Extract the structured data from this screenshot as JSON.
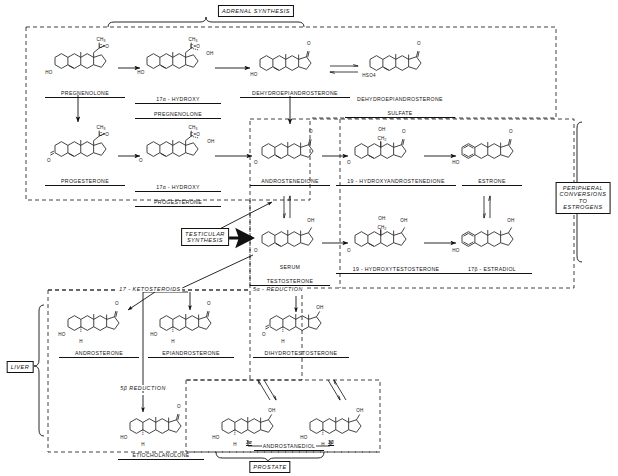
{
  "diagram": {
    "region_boxes": [
      {
        "id": "adrenal",
        "label": "ADRENAL SYNTHESIS"
      },
      {
        "id": "testicular",
        "label": "TESTICULAR\nSYNTHESIS"
      },
      {
        "id": "peripheral",
        "label": "PERIPHERAL\nCONVERSIONS\nTO ESTROGENS"
      },
      {
        "id": "liver",
        "label": "LIVER"
      },
      {
        "id": "prostate",
        "label": "PROSTATE"
      }
    ],
    "pathway_labels": [
      {
        "id": "ketosteroids",
        "label": "17 - KETOSTEROIDS"
      },
      {
        "id": "five-alpha",
        "label": "5α - REDUCTION"
      },
      {
        "id": "five-beta",
        "label": "5β REDUCTION"
      }
    ],
    "compounds": [
      {
        "id": "pregnenolone",
        "name": "PREGNENOLONE",
        "line2": ""
      },
      {
        "id": "17a-hydroxypregnenolone",
        "name": "17α - HYDROXY",
        "line2": "PREGNENOLONE"
      },
      {
        "id": "dhea",
        "name": "DEHYDROEPIANDROSTERONE",
        "line2": ""
      },
      {
        "id": "dhea-sulfate",
        "name": "DEHYDROEPIANDROSTERONE",
        "line2": "SULFATE"
      },
      {
        "id": "progesterone",
        "name": "PROGESTERONE",
        "line2": ""
      },
      {
        "id": "17a-hydroxyprogesterone",
        "name": "17α - HYDROXY",
        "line2": "PROGESTERONE"
      },
      {
        "id": "androstenedione",
        "name": "ANDROSTENEDIONE",
        "line2": ""
      },
      {
        "id": "19-hydroxyandrostenedione",
        "name": "19 - HYDROXYANDROSTENEDIONE",
        "line2": ""
      },
      {
        "id": "estrone",
        "name": "ESTRONE",
        "line2": ""
      },
      {
        "id": "serum-testosterone",
        "name": "SERUM",
        "line2": "TESTOSTERONE"
      },
      {
        "id": "19-hydroxytestosterone",
        "name": "19 - HYDROXYTESTOSTERONE",
        "line2": ""
      },
      {
        "id": "17b-estradiol",
        "name": "17β - ESTRADIOL",
        "line2": ""
      },
      {
        "id": "androsterone",
        "name": "ANDROSTERONE",
        "line2": ""
      },
      {
        "id": "epiandrosterone",
        "name": "EPIANDROSTERONE",
        "line2": ""
      },
      {
        "id": "dihydrotestosterone",
        "name": "DIHYDROTESTOSTERONE",
        "line2": ""
      },
      {
        "id": "etiocholanolone",
        "name": "ETIOCHOLANOLONE",
        "line2": ""
      },
      {
        "id": "androstanediol",
        "name": "ANDROSTANEDIOL",
        "line2": ""
      }
    ],
    "annotations": [
      {
        "id": "hso4",
        "label": "HSO4"
      },
      {
        "id": "androstanediol-3alpha",
        "label": "3α"
      },
      {
        "id": "androstanediol-3beta",
        "label": "3β"
      }
    ],
    "structure_atoms": {
      "ho": "HO",
      "o": "O",
      "oh": "OH",
      "h": "H",
      "ch3": "CH3",
      "ch2": "CH2",
      "co": "C=O"
    }
  }
}
